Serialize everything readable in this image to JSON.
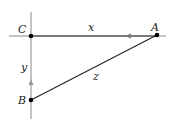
{
  "diagram": {
    "points": [
      {
        "id": "C",
        "label": "C",
        "x": 31,
        "y": 36
      },
      {
        "id": "A",
        "label": "A",
        "x": 157,
        "y": 35
      },
      {
        "id": "B",
        "label": "B",
        "x": 31,
        "y": 100
      }
    ],
    "segments": [
      {
        "id": "x",
        "label": "x",
        "from": "A",
        "to": "C",
        "arrow": "toward C"
      },
      {
        "id": "y",
        "label": "y",
        "from": "B",
        "to": "C",
        "arrow": "toward C"
      },
      {
        "id": "z",
        "label": "z",
        "from": "A",
        "to": "B"
      }
    ],
    "colors": {
      "line": "#222222",
      "axis": "#888888"
    }
  }
}
